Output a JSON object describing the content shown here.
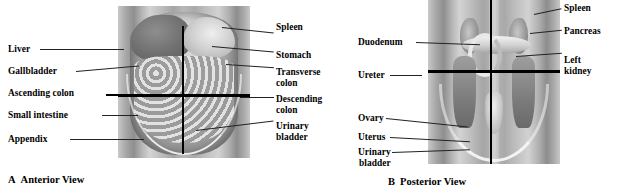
{
  "figure": {
    "panels": [
      {
        "id": "panel-a",
        "caption_letter": "A",
        "caption_title": "Anterior View",
        "view": "Anterior View",
        "image_alt": "anterior-abdomen-quadrants",
        "labels_left": [
          {
            "name": "liver",
            "text": "Liver"
          },
          {
            "name": "gallbladder",
            "text": "Gallbladder"
          },
          {
            "name": "ascending-colon",
            "text": "Ascending colon"
          },
          {
            "name": "small-intestine",
            "text": "Small intestine"
          },
          {
            "name": "appendix",
            "text": "Appendix"
          }
        ],
        "labels_right": [
          {
            "name": "spleen",
            "text": "Spleen"
          },
          {
            "name": "stomach",
            "text": "Stomach"
          },
          {
            "name": "transverse-colon",
            "text": "Transverse",
            "text2": "colon"
          },
          {
            "name": "descending-colon",
            "text": "Descending",
            "text2": "colon"
          },
          {
            "name": "urinary-bladder",
            "text": "Urinary",
            "text2": "bladder"
          }
        ]
      },
      {
        "id": "panel-b",
        "caption_letter": "B",
        "caption_title": "Posterior View",
        "view": "Posterior View",
        "image_alt": "posterior-abdomen-quadrants",
        "labels_left": [
          {
            "name": "duodenum",
            "text": "Duodenum"
          },
          {
            "name": "ureter",
            "text": "Ureter"
          },
          {
            "name": "ovary",
            "text": "Ovary"
          },
          {
            "name": "uterus",
            "text": "Uterus"
          },
          {
            "name": "urinary-bladder",
            "text": "Urinary",
            "text2": "bladder"
          }
        ],
        "labels_right": [
          {
            "name": "spleen",
            "text": "Spleen"
          },
          {
            "name": "pancreas",
            "text": "Pancreas"
          },
          {
            "name": "left-kidney",
            "text": "Left",
            "text2": "kidney"
          }
        ]
      }
    ],
    "colors": {
      "label_text": "#000000",
      "leader_line": "#222222",
      "quadrant_line": "#000000",
      "background": "#ffffff"
    }
  }
}
